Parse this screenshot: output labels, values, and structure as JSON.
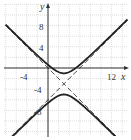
{
  "chart_data": {
    "type": "line",
    "title": "",
    "xlabel": "x",
    "ylabel": "y",
    "xlim": [
      -8,
      15
    ],
    "ylim": [
      -12,
      12
    ],
    "grid": true,
    "grid_step": 2,
    "x_tick_labels": [
      "-4",
      "12"
    ],
    "y_tick_labels": [
      "8",
      "4",
      "-4",
      "-8"
    ],
    "series": [
      {
        "name": "hyperbola upper branch",
        "style": "solid",
        "equation": "(y+3)^2/4 - (x-3)^2/4 = 1, y >= -1",
        "x": [
          -8,
          -4,
          -2,
          0,
          2,
          3,
          4,
          6,
          8,
          10,
          14
        ],
        "y": [
          8.4,
          4.3,
          2.4,
          0.6,
          -0.76,
          -1,
          -0.76,
          0.6,
          2.4,
          4.3,
          8.4
        ]
      },
      {
        "name": "hyperbola lower branch",
        "style": "solid",
        "equation": "y <= -5",
        "x": [
          -8,
          -4,
          -2,
          0,
          2,
          3,
          4,
          6,
          8,
          10,
          14
        ],
        "y": [
          -14.4,
          -10.3,
          -8.4,
          -6.6,
          -5.24,
          -5,
          -5.24,
          -6.6,
          -8.4,
          -10.3,
          -14.4
        ]
      },
      {
        "name": "asymptote 1",
        "style": "dashed",
        "equation": "y = x - 6"
      },
      {
        "name": "asymptote 2",
        "style": "dashed",
        "equation": "y = -x"
      }
    ],
    "center": [
      3,
      -3
    ],
    "vertices": [
      [
        3,
        -1
      ],
      [
        3,
        -5
      ]
    ]
  }
}
